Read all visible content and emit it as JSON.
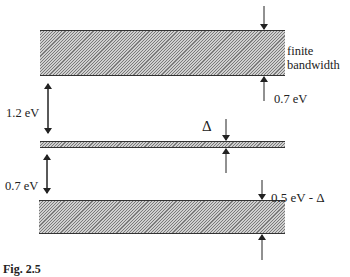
{
  "diagram": {
    "type": "energy-band-diagram",
    "bands": [
      {
        "id": "upper-band",
        "description": "hatched band with finite bandwidth",
        "width_label": "0.7 eV",
        "side_note": [
          "finite",
          "bandwidth"
        ]
      },
      {
        "id": "middle-band",
        "description": "narrow hatched band",
        "width_label": "Δ"
      },
      {
        "id": "lower-band",
        "description": "hatched band",
        "width_label": "0.5 eV - Δ"
      }
    ],
    "gaps": [
      {
        "between": [
          "middle-band",
          "upper-band"
        ],
        "label": "1.2 eV"
      },
      {
        "between": [
          "lower-band",
          "middle-band"
        ],
        "label": "0.7 eV"
      }
    ],
    "labels": {
      "gap_upper": "1.2 eV",
      "gap_lower": "0.7 eV",
      "finite_line1": "finite",
      "finite_line2": "bandwidth",
      "upper_width": "0.7 eV",
      "delta": "Δ",
      "lower_width": "0.5 eV - Δ"
    },
    "caption_partial": "Fig. 2.5"
  },
  "colors": {
    "hatch_fill": "#cfcfcf",
    "line": "#333333",
    "text": "#222222"
  }
}
